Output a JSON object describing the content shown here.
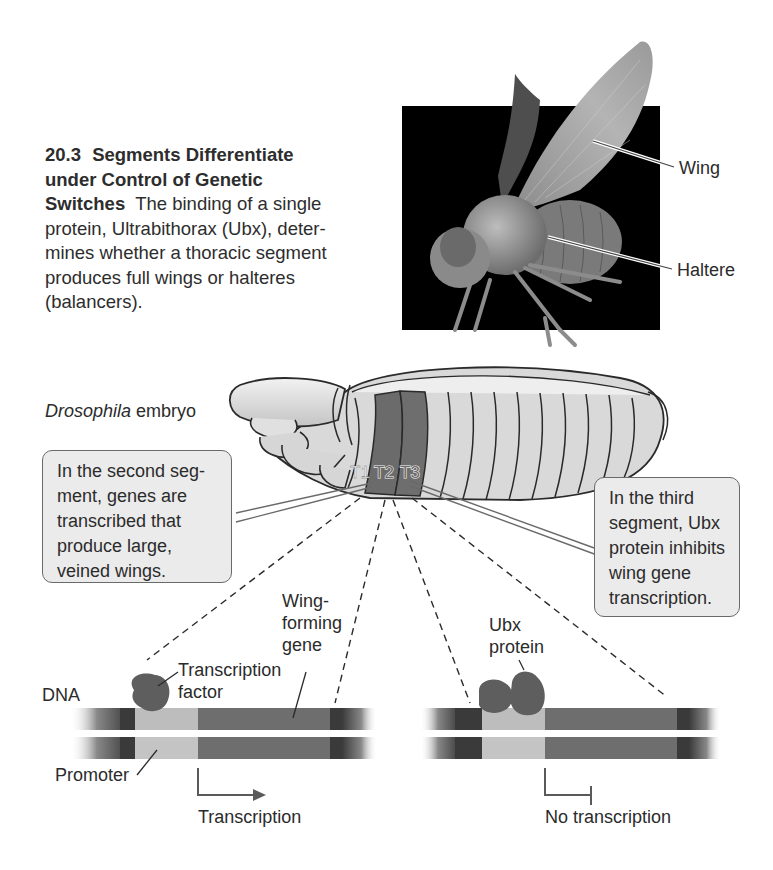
{
  "figure": {
    "number": "20.3",
    "title": "Segments Differentiate under Control of Genetic Switches",
    "title_line1": "Segments Differentiate",
    "title_line2": "under Control of Genetic",
    "title_line3": "Switches",
    "body": "The binding of a single protein, Ultrabithorax (Ubx), determines whether a thoracic segment produces full wings or halteres (balancers).",
    "body_line1": "The binding of a single",
    "body_line2": "protein, Ultrabithorax (Ubx), deter-",
    "body_line3": "mines whether a thoracic segment",
    "body_line4": "produces full wings or halteres",
    "body_line5": "(balancers)."
  },
  "photo": {
    "subject": "fruit fly (Drosophila) scanning electron micrograph",
    "labels": {
      "wing": "Wing",
      "haltere": "Haltere"
    }
  },
  "embryo": {
    "label_italic": "Drosophila",
    "label_rest": " embryo",
    "segments": [
      "T1",
      "T2",
      "T3"
    ]
  },
  "callouts": {
    "left": {
      "text": "In the second segment, genes are transcribed that produce large, veined wings.",
      "lines": [
        "In the second seg-",
        "ment, genes are",
        "transcribed that",
        "produce large,",
        "veined wings."
      ]
    },
    "right": {
      "text": "In the third segment, Ubx protein inhibits wing gene transcription.",
      "lines": [
        "In the third",
        "segment, Ubx",
        "protein inhibits",
        "wing gene",
        "transcription."
      ]
    }
  },
  "dna_left": {
    "dna_label": "DNA",
    "tf_label_line1": "Transcription",
    "tf_label_line2": "factor",
    "gene_label_line1": "Wing-",
    "gene_label_line2": "forming",
    "gene_label_line3": "gene",
    "promoter_label": "Promoter",
    "result_label": "Transcription"
  },
  "dna_right": {
    "ubx_label_line1": "Ubx",
    "ubx_label_line2": "protein",
    "result_label": "No transcription"
  },
  "colors": {
    "background": "#ffffff",
    "photo_bg": "#000000",
    "embryo_fill": "#d6d6d6",
    "segment_highlight": "#6c6c6c",
    "callout_fill": "#ebebeb",
    "dna_dark": "#3c3c3c",
    "dna_gene": "#6e6e6e",
    "dna_promoter": "#bdbdbd",
    "protein": "#5e5e5e"
  }
}
